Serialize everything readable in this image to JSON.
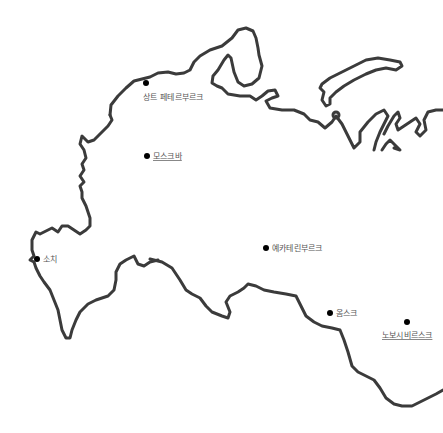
{
  "map": {
    "region": "Russia (western/central)",
    "coast_color": "#3b3b3b",
    "background": "#ffffff",
    "cities": [
      {
        "name": "상트 페테르부르크",
        "x": 146,
        "y": 83,
        "label_pos": "below"
      },
      {
        "name": "모스크바",
        "x": 147,
        "y": 155,
        "label_pos": "right"
      },
      {
        "name": "소치",
        "x": 37,
        "y": 258,
        "label_pos": "right"
      },
      {
        "name": "예카테린부르크",
        "x": 266,
        "y": 247,
        "label_pos": "right"
      },
      {
        "name": "옴스크",
        "x": 330,
        "y": 312,
        "label_pos": "right"
      },
      {
        "name": "노보시비르스크",
        "x": 385,
        "y": 323,
        "label_pos": "below"
      }
    ]
  }
}
